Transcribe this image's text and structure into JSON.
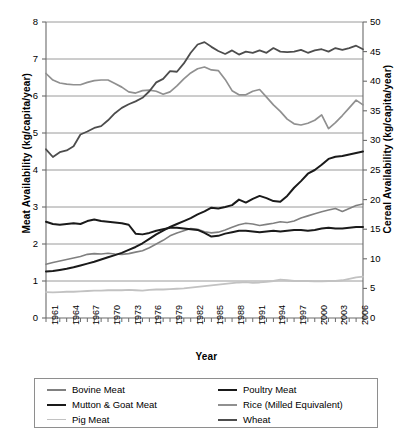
{
  "chart_data": {
    "type": "line",
    "title": "",
    "xlabel": "Year",
    "ylabel": "Meat Availability (kg/capita/year)",
    "ylabel_secondary": "Cereal Availability (kg/capita/year)",
    "xlim": [
      1961,
      2007
    ],
    "ylim": [
      0,
      8
    ],
    "ylim_secondary": [
      0,
      50
    ],
    "yticks": [
      "0",
      "1",
      "2",
      "3",
      "4",
      "5",
      "6",
      "7",
      "8"
    ],
    "yticks_secondary": [
      "0",
      "5",
      "10",
      "15",
      "20",
      "25",
      "30",
      "35",
      "40",
      "45",
      "50"
    ],
    "xticks": [
      "1961",
      "1964",
      "1967",
      "1970",
      "1973",
      "1976",
      "1979",
      "1982",
      "1985",
      "1988",
      "1991",
      "1994",
      "1997",
      "2000",
      "2003",
      "2006"
    ],
    "grid": true,
    "grid_color": "#9a9a9a",
    "legend_position": "below",
    "x": [
      1961,
      1962,
      1963,
      1964,
      1965,
      1966,
      1967,
      1968,
      1969,
      1970,
      1971,
      1972,
      1973,
      1974,
      1975,
      1976,
      1977,
      1978,
      1979,
      1980,
      1981,
      1982,
      1983,
      1984,
      1985,
      1986,
      1987,
      1988,
      1989,
      1990,
      1991,
      1992,
      1993,
      1994,
      1995,
      1996,
      1997,
      1998,
      1999,
      2000,
      2001,
      2002,
      2003,
      2004,
      2005,
      2006,
      2007
    ],
    "series": [
      {
        "name": "Bovine Meat",
        "axis": "left",
        "color": "#808080",
        "width": 1.6,
        "values": [
          1.45,
          1.5,
          1.54,
          1.58,
          1.62,
          1.66,
          1.72,
          1.74,
          1.73,
          1.75,
          1.73,
          1.72,
          1.74,
          1.78,
          1.82,
          1.9,
          2.0,
          2.1,
          2.22,
          2.3,
          2.36,
          2.42,
          2.4,
          2.33,
          2.3,
          2.32,
          2.38,
          2.45,
          2.52,
          2.56,
          2.54,
          2.5,
          2.53,
          2.56,
          2.6,
          2.58,
          2.62,
          2.7,
          2.76,
          2.82,
          2.87,
          2.92,
          2.96,
          2.88,
          2.96,
          3.04,
          3.08
        ]
      },
      {
        "name": "Mutton & Goat Meat",
        "axis": "left",
        "color": "#1a1a1a",
        "width": 2.0,
        "values": [
          2.6,
          2.54,
          2.52,
          2.54,
          2.56,
          2.54,
          2.62,
          2.66,
          2.62,
          2.6,
          2.58,
          2.56,
          2.52,
          2.28,
          2.26,
          2.3,
          2.36,
          2.4,
          2.44,
          2.44,
          2.42,
          2.4,
          2.38,
          2.3,
          2.2,
          2.22,
          2.28,
          2.32,
          2.36,
          2.36,
          2.34,
          2.32,
          2.34,
          2.36,
          2.34,
          2.36,
          2.38,
          2.38,
          2.36,
          2.38,
          2.42,
          2.44,
          2.42,
          2.42,
          2.44,
          2.46,
          2.46
        ]
      },
      {
        "name": "Pig Meat",
        "axis": "left",
        "color": "#c2c2c2",
        "width": 1.8,
        "values": [
          0.7,
          0.69,
          0.7,
          0.71,
          0.71,
          0.72,
          0.73,
          0.74,
          0.74,
          0.75,
          0.75,
          0.75,
          0.76,
          0.75,
          0.74,
          0.76,
          0.77,
          0.77,
          0.78,
          0.79,
          0.8,
          0.82,
          0.84,
          0.86,
          0.88,
          0.9,
          0.92,
          0.94,
          0.96,
          0.97,
          0.95,
          0.96,
          0.98,
          1.0,
          1.04,
          1.02,
          1.0,
          1.0,
          1.0,
          0.99,
          0.99,
          1.0,
          1.0,
          1.02,
          1.06,
          1.1,
          1.12
        ]
      },
      {
        "name": "Poultry Meat",
        "axis": "left",
        "color": "#1a1a1a",
        "width": 2.0,
        "values": [
          1.26,
          1.27,
          1.3,
          1.33,
          1.37,
          1.42,
          1.47,
          1.52,
          1.58,
          1.64,
          1.7,
          1.76,
          1.84,
          1.92,
          2.02,
          2.14,
          2.26,
          2.36,
          2.46,
          2.54,
          2.62,
          2.7,
          2.8,
          2.88,
          2.98,
          2.96,
          3.0,
          3.05,
          3.2,
          3.12,
          3.22,
          3.3,
          3.24,
          3.16,
          3.14,
          3.3,
          3.52,
          3.7,
          3.9,
          4.0,
          4.14,
          4.3,
          4.36,
          4.38,
          4.42,
          4.46,
          4.5
        ]
      },
      {
        "name": "Rice (Milled Equivalent)",
        "axis": "right",
        "color": "#909090",
        "width": 1.7,
        "values": [
          41.3,
          40.2,
          39.7,
          39.5,
          39.4,
          39.4,
          39.8,
          40.1,
          40.2,
          40.2,
          39.6,
          39.0,
          38.2,
          38.0,
          38.4,
          38.5,
          38.3,
          37.8,
          38.2,
          39.2,
          40.4,
          41.4,
          42.1,
          42.4,
          41.9,
          41.8,
          40.3,
          38.4,
          37.7,
          37.7,
          38.3,
          38.6,
          37.3,
          36.0,
          34.9,
          33.6,
          32.8,
          32.6,
          32.9,
          33.4,
          34.3,
          32.0,
          33.0,
          34.2,
          35.5,
          36.8,
          36.0
        ]
      },
      {
        "name": "Wheat",
        "axis": "right",
        "color": "#4d4d4d",
        "width": 1.8,
        "values": [
          28.5,
          27.2,
          28.0,
          28.3,
          29.0,
          31.0,
          31.5,
          32.1,
          32.4,
          33.4,
          34.6,
          35.5,
          36.1,
          36.6,
          37.2,
          38.3,
          39.8,
          40.4,
          41.7,
          41.6,
          43.0,
          44.8,
          46.2,
          46.6,
          45.8,
          45.1,
          44.6,
          45.2,
          44.5,
          45.0,
          44.8,
          45.2,
          44.8,
          45.6,
          45.0,
          44.9,
          45.0,
          45.3,
          44.8,
          45.2,
          45.4,
          45.0,
          45.6,
          45.3,
          45.6,
          46.0,
          45.4
        ]
      }
    ]
  },
  "legend": {
    "column_1": [
      {
        "label": "Bovine Meat",
        "color": "#808080"
      },
      {
        "label": "Mutton & Goat Meat",
        "color": "#1a1a1a"
      },
      {
        "label": "Pig Meat",
        "color": "#c2c2c2"
      }
    ],
    "column_2": [
      {
        "label": "Poultry Meat",
        "color": "#1a1a1a"
      },
      {
        "label": "Rice (Milled Equivalent)",
        "color": "#909090"
      },
      {
        "label": "Wheat",
        "color": "#4d4d4d"
      }
    ]
  }
}
